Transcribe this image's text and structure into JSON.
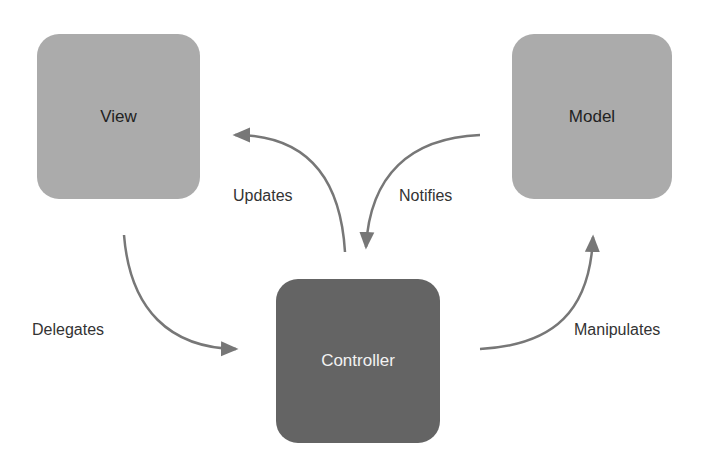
{
  "nodes": {
    "view": {
      "label": "View",
      "color": "#ababab"
    },
    "model": {
      "label": "Model",
      "color": "#ababab"
    },
    "controller": {
      "label": "Controller",
      "color": "#646464"
    }
  },
  "edges": {
    "updates": {
      "label": "Updates",
      "from": "Controller",
      "to": "View"
    },
    "notifies": {
      "label": "Notifies",
      "from": "Model",
      "to": "Controller"
    },
    "delegates": {
      "label": "Delegates",
      "from": "View",
      "to": "Controller"
    },
    "manipulates": {
      "label": "Manipulates",
      "from": "Controller",
      "to": "Model"
    }
  },
  "arrow_color": "#777777"
}
